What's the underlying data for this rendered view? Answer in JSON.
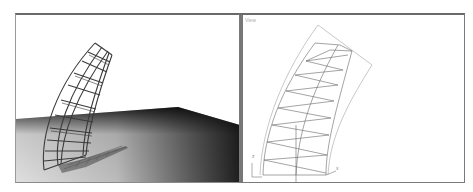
{
  "viewports": {
    "perspective": {
      "label": "",
      "colors": {
        "sky": "#ffffff",
        "ground_light": "#d8d8d8",
        "ground_dark": "#1a1a1a",
        "wire": "#333333"
      }
    },
    "orthographic": {
      "label": "View",
      "axis_labels": {
        "vertical": "z",
        "horizontal": "x"
      },
      "colors": {
        "background": "#ffffff",
        "wire": "#555555",
        "outline": "#aaaaaa"
      }
    }
  }
}
